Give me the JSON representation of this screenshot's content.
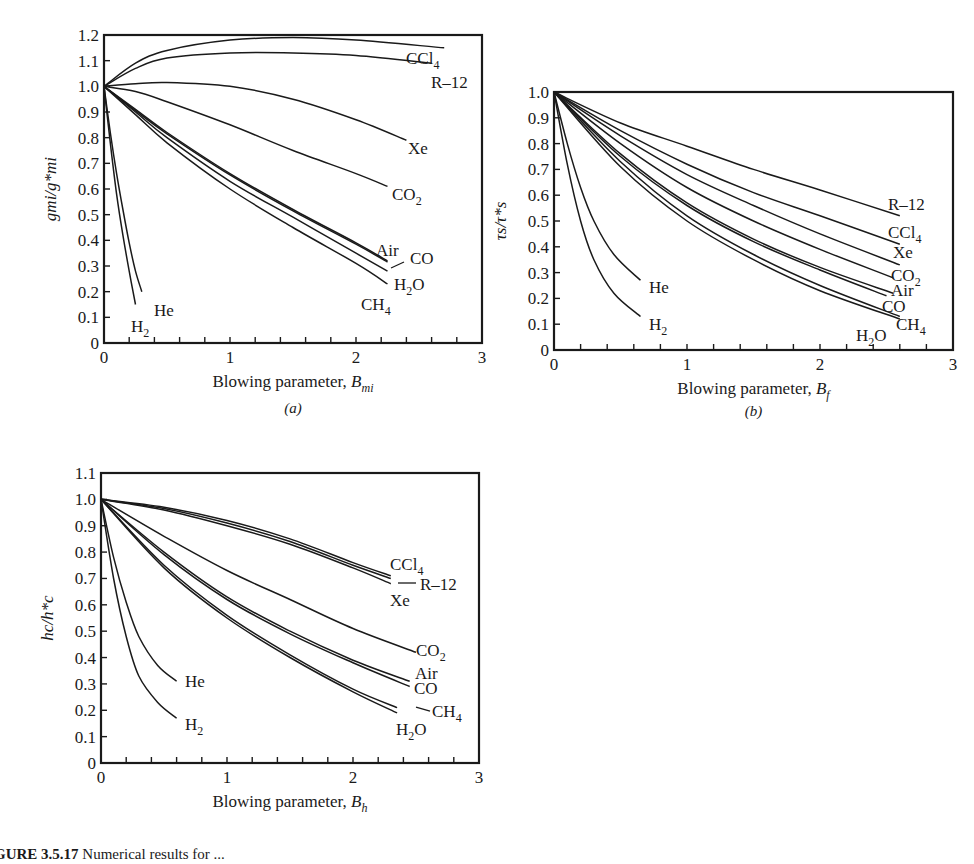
{
  "caption": {
    "label": "GURE 3.5.17",
    "text": " Numerical results for ..."
  },
  "chart_data": [
    {
      "id": "a",
      "type": "line",
      "panel_label": "(a)",
      "title": "",
      "xlabel": "Blowing parameter, B_mi",
      "xlabel_main": "Blowing parameter, ",
      "xlabel_sym": "B",
      "xlabel_sub": "mi",
      "ylabel": "g_mi/g*_mi",
      "xlim": [
        0,
        3
      ],
      "ylim": [
        0,
        1.2
      ],
      "xticks": [
        "0",
        "1",
        "2",
        "3"
      ],
      "yticks": [
        "0",
        "0.1",
        "0.2",
        "0.3",
        "0.4",
        "0.5",
        "0.6",
        "0.7",
        "0.8",
        "0.9",
        "1.0",
        "1.1",
        "1.2"
      ],
      "grid": false,
      "box": {
        "x0": 104,
        "y0": 343,
        "x1": 482,
        "ytop": 35
      },
      "series": [
        {
          "name": "CCl4",
          "x": [
            0,
            0.25,
            0.5,
            1.0,
            1.5,
            2.0,
            2.7
          ],
          "values": [
            1.0,
            1.09,
            1.14,
            1.18,
            1.19,
            1.18,
            1.15
          ]
        },
        {
          "name": "R-12",
          "x": [
            0,
            0.25,
            0.5,
            1.0,
            1.5,
            2.0,
            2.6
          ],
          "values": [
            1.0,
            1.07,
            1.11,
            1.13,
            1.13,
            1.12,
            1.09
          ]
        },
        {
          "name": "Xe",
          "x": [
            0,
            0.25,
            0.5,
            1.0,
            1.5,
            2.0,
            2.4
          ],
          "values": [
            1.0,
            1.01,
            1.015,
            1.0,
            0.95,
            0.87,
            0.79
          ]
        },
        {
          "name": "CO2",
          "x": [
            0,
            0.25,
            0.5,
            1.0,
            1.5,
            2.0,
            2.25
          ],
          "values": [
            1.0,
            0.98,
            0.94,
            0.85,
            0.75,
            0.66,
            0.61
          ]
        },
        {
          "name": "Air",
          "x": [
            0,
            0.25,
            0.5,
            1.0,
            1.5,
            2.0,
            2.25
          ],
          "values": [
            1.0,
            0.91,
            0.82,
            0.66,
            0.52,
            0.39,
            0.32
          ]
        },
        {
          "name": "CO",
          "x": [
            0,
            0.25,
            0.5,
            1.0,
            1.5,
            2.0,
            2.25
          ],
          "values": [
            1.0,
            0.905,
            0.815,
            0.655,
            0.515,
            0.385,
            0.315
          ]
        },
        {
          "name": "H2O",
          "x": [
            0,
            0.25,
            0.5,
            1.0,
            1.5,
            2.0,
            2.25
          ],
          "values": [
            1.0,
            0.9,
            0.8,
            0.63,
            0.49,
            0.35,
            0.28
          ]
        },
        {
          "name": "CH4",
          "x": [
            0,
            0.25,
            0.5,
            1.0,
            1.5,
            2.0,
            2.25
          ],
          "values": [
            1.0,
            0.89,
            0.78,
            0.6,
            0.45,
            0.31,
            0.23
          ]
        },
        {
          "name": "He",
          "x": [
            0,
            0.05,
            0.1,
            0.15,
            0.2,
            0.25,
            0.3
          ],
          "values": [
            1.0,
            0.82,
            0.66,
            0.52,
            0.39,
            0.28,
            0.2
          ]
        },
        {
          "name": "H2",
          "x": [
            0,
            0.05,
            0.1,
            0.15,
            0.2,
            0.25
          ],
          "values": [
            1.0,
            0.78,
            0.58,
            0.42,
            0.28,
            0.15
          ]
        }
      ],
      "labels": [
        {
          "text": "CCl",
          "sub": "4",
          "x": 406,
          "y": 64
        },
        {
          "text": "R–12",
          "sub": "",
          "x": 431,
          "y": 88
        },
        {
          "text": "Xe",
          "sub": "",
          "x": 408,
          "y": 154
        },
        {
          "text": "CO",
          "sub": "2",
          "x": 392,
          "y": 200
        },
        {
          "text": "Air",
          "sub": "",
          "x": 376,
          "y": 256
        },
        {
          "text": "CO",
          "sub": "",
          "x": 410,
          "y": 264
        },
        {
          "text": "H",
          "sub": "2",
          "sub2": "O",
          "x": 394,
          "y": 290
        },
        {
          "text": "CH",
          "sub": "4",
          "x": 361,
          "y": 310
        },
        {
          "text": "He",
          "sub": "",
          "x": 154,
          "y": 316
        },
        {
          "text": "H",
          "sub": "2",
          "x": 131,
          "y": 332
        }
      ],
      "leaders": [
        [
          391,
          268,
          404,
          262
        ]
      ]
    },
    {
      "id": "b",
      "type": "line",
      "panel_label": "(b)",
      "title": "",
      "xlabel": "Blowing parameter, B_f",
      "xlabel_main": "Blowing parameter, ",
      "xlabel_sym": "B",
      "xlabel_sub": "f",
      "ylabel": "τ_s/τ*_s",
      "xlim": [
        0,
        3
      ],
      "ylim": [
        0,
        1.0
      ],
      "xticks": [
        "0",
        "1",
        "2",
        "3"
      ],
      "yticks": [
        "0",
        "0.1",
        "0.2",
        "0.3",
        "0.4",
        "0.5",
        "0.6",
        "0.7",
        "0.8",
        "0.9",
        "1.0"
      ],
      "grid": false,
      "box": {
        "x0": 554,
        "y0": 350,
        "x1": 953,
        "ytop": 92
      },
      "series": [
        {
          "name": "R-12",
          "x": [
            0,
            0.5,
            1.0,
            1.5,
            2.0,
            2.6
          ],
          "values": [
            1.0,
            0.88,
            0.79,
            0.7,
            0.62,
            0.52
          ]
        },
        {
          "name": "CCl4",
          "x": [
            0,
            0.5,
            1.0,
            1.5,
            2.0,
            2.6
          ],
          "values": [
            1.0,
            0.85,
            0.72,
            0.61,
            0.52,
            0.41
          ]
        },
        {
          "name": "Xe",
          "x": [
            0,
            0.5,
            1.0,
            1.5,
            2.0,
            2.6
          ],
          "values": [
            1.0,
            0.83,
            0.68,
            0.56,
            0.45,
            0.33
          ]
        },
        {
          "name": "CO2",
          "x": [
            0,
            0.5,
            1.0,
            1.5,
            2.0,
            2.55
          ],
          "values": [
            1.0,
            0.8,
            0.63,
            0.5,
            0.39,
            0.28
          ]
        },
        {
          "name": "Air",
          "x": [
            0,
            0.5,
            1.0,
            1.5,
            2.0,
            2.55
          ],
          "values": [
            1.0,
            0.76,
            0.57,
            0.43,
            0.32,
            0.22
          ]
        },
        {
          "name": "CO",
          "x": [
            0,
            0.5,
            1.0,
            1.5,
            2.0,
            2.5
          ],
          "values": [
            1.0,
            0.75,
            0.56,
            0.42,
            0.31,
            0.21
          ]
        },
        {
          "name": "H2O",
          "x": [
            0,
            0.5,
            1.0,
            1.5,
            2.0,
            2.6
          ],
          "values": [
            1.0,
            0.73,
            0.52,
            0.37,
            0.25,
            0.13
          ]
        },
        {
          "name": "CH4",
          "x": [
            0,
            0.5,
            1.0,
            1.5,
            2.0,
            2.6
          ],
          "values": [
            1.0,
            0.71,
            0.5,
            0.35,
            0.23,
            0.12
          ]
        },
        {
          "name": "He",
          "x": [
            0,
            0.1,
            0.2,
            0.3,
            0.45,
            0.65
          ],
          "values": [
            1.0,
            0.8,
            0.63,
            0.5,
            0.37,
            0.27
          ]
        },
        {
          "name": "H2",
          "x": [
            0,
            0.1,
            0.2,
            0.3,
            0.45,
            0.65
          ],
          "values": [
            1.0,
            0.72,
            0.5,
            0.35,
            0.22,
            0.13
          ]
        }
      ],
      "labels": [
        {
          "text": "R–12",
          "sub": "",
          "x": 888,
          "y": 210
        },
        {
          "text": "CCl",
          "sub": "4",
          "x": 888,
          "y": 238
        },
        {
          "text": "Xe",
          "sub": "",
          "x": 893,
          "y": 258
        },
        {
          "text": "CO",
          "sub": "2",
          "x": 891,
          "y": 281
        },
        {
          "text": "Air",
          "sub": "",
          "x": 891,
          "y": 296
        },
        {
          "text": "CO",
          "sub": "",
          "x": 882,
          "y": 312
        },
        {
          "text": "CH",
          "sub": "4",
          "x": 896,
          "y": 330
        },
        {
          "text": "H",
          "sub": "2",
          "sub2": "O",
          "x": 856,
          "y": 341
        },
        {
          "text": "He",
          "sub": "",
          "x": 649,
          "y": 293
        },
        {
          "text": "H",
          "sub": "2",
          "x": 649,
          "y": 330
        }
      ],
      "leaders": []
    },
    {
      "id": "c",
      "type": "line",
      "panel_label": "",
      "title": "",
      "xlabel": "Blowing parameter, B_h",
      "xlabel_main": "Blowing parameter, ",
      "xlabel_sym": "B",
      "xlabel_sub": "h",
      "ylabel": "h_c/h*_c",
      "xlim": [
        0,
        3
      ],
      "ylim": [
        0,
        1.1
      ],
      "xticks": [
        "0",
        "1",
        "2",
        "3"
      ],
      "yticks": [
        "0",
        "0.1",
        "0.2",
        "0.3",
        "0.4",
        "0.5",
        "0.6",
        "0.7",
        "0.8",
        "0.9",
        "1.0",
        "1.1"
      ],
      "grid": false,
      "box": {
        "x0": 101,
        "y0": 763,
        "x1": 479,
        "ytop": 473
      },
      "series": [
        {
          "name": "CCl4",
          "x": [
            0,
            0.5,
            1.0,
            1.5,
            2.0,
            2.3
          ],
          "values": [
            1.0,
            0.97,
            0.92,
            0.85,
            0.76,
            0.71
          ]
        },
        {
          "name": "R-12",
          "x": [
            0,
            0.5,
            1.0,
            1.5,
            2.0,
            2.3
          ],
          "values": [
            1.0,
            0.965,
            0.91,
            0.84,
            0.75,
            0.7
          ]
        },
        {
          "name": "Xe",
          "x": [
            0,
            0.5,
            1.0,
            1.5,
            2.0,
            2.3
          ],
          "values": [
            1.0,
            0.96,
            0.9,
            0.83,
            0.74,
            0.68
          ]
        },
        {
          "name": "CO2",
          "x": [
            0,
            0.5,
            1.0,
            1.5,
            2.0,
            2.5
          ],
          "values": [
            1.0,
            0.86,
            0.73,
            0.62,
            0.51,
            0.42
          ]
        },
        {
          "name": "Air",
          "x": [
            0,
            0.5,
            1.0,
            1.5,
            2.0,
            2.45
          ],
          "values": [
            1.0,
            0.8,
            0.63,
            0.5,
            0.39,
            0.31
          ]
        },
        {
          "name": "CO",
          "x": [
            0,
            0.5,
            1.0,
            1.5,
            2.0,
            2.45
          ],
          "values": [
            1.0,
            0.79,
            0.62,
            0.49,
            0.38,
            0.29
          ]
        },
        {
          "name": "CH4",
          "x": [
            0,
            0.5,
            1.0,
            1.5,
            2.0,
            2.35
          ],
          "values": [
            1.0,
            0.75,
            0.56,
            0.41,
            0.28,
            0.21
          ]
        },
        {
          "name": "H2O",
          "x": [
            0,
            0.5,
            1.0,
            1.5,
            2.0,
            2.35
          ],
          "values": [
            1.0,
            0.74,
            0.55,
            0.4,
            0.27,
            0.19
          ]
        },
        {
          "name": "He",
          "x": [
            0,
            0.1,
            0.2,
            0.3,
            0.45,
            0.6
          ],
          "values": [
            1.0,
            0.78,
            0.61,
            0.48,
            0.37,
            0.31
          ]
        },
        {
          "name": "H2",
          "x": [
            0,
            0.1,
            0.2,
            0.3,
            0.45,
            0.6
          ],
          "values": [
            1.0,
            0.7,
            0.48,
            0.33,
            0.23,
            0.17
          ]
        }
      ],
      "labels": [
        {
          "text": "CCl",
          "sub": "4",
          "x": 390,
          "y": 570
        },
        {
          "text": "R–12",
          "sub": "",
          "x": 420,
          "y": 590
        },
        {
          "text": "Xe",
          "sub": "",
          "x": 390,
          "y": 606
        },
        {
          "text": "CO",
          "sub": "2",
          "x": 416,
          "y": 656
        },
        {
          "text": "Air",
          "sub": "",
          "x": 415,
          "y": 679
        },
        {
          "text": "CO",
          "sub": "",
          "x": 414,
          "y": 694
        },
        {
          "text": "CH",
          "sub": "4",
          "x": 432,
          "y": 717
        },
        {
          "text": "H",
          "sub": "2",
          "sub2": "O",
          "x": 396,
          "y": 735
        },
        {
          "text": "He",
          "sub": "",
          "x": 185,
          "y": 687
        },
        {
          "text": "H",
          "sub": "2",
          "x": 185,
          "y": 730
        }
      ],
      "leaders": [
        [
          398,
          583,
          416,
          583
        ],
        [
          416,
          707,
          430,
          711
        ]
      ]
    }
  ]
}
